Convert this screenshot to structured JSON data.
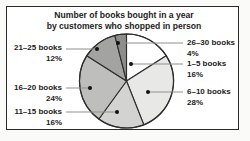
{
  "chart_data": {
    "type": "pie",
    "title_line1": "Number of books bought in a year",
    "title_line2": "by customers who shopped in person",
    "start_angle_deg": 0,
    "direction": "clockwise",
    "legend": "none",
    "label_style": "external-labels-with-dot-markers-and-leader-lines",
    "slices": [
      {
        "label": "1–5 books",
        "percent": "16%",
        "value": 16,
        "color": "#ffffff",
        "label_side": "right"
      },
      {
        "label": "6–10 books",
        "percent": "28%",
        "value": 28,
        "color": "#e8e8e7",
        "label_side": "right"
      },
      {
        "label": "11–15 books",
        "percent": "16%",
        "value": 16,
        "color": "#d3d3d2",
        "label_side": "left"
      },
      {
        "label": "16–20 books",
        "percent": "24%",
        "value": 24,
        "color": "#bebebd",
        "label_side": "left"
      },
      {
        "label": "21–25 books",
        "percent": "12%",
        "value": 12,
        "color": "#a3a3a2",
        "label_side": "left"
      },
      {
        "label": "26–30 books",
        "percent": "4%",
        "value": 4,
        "color": "#8d8d8c",
        "label_side": "right"
      }
    ]
  },
  "colors": {
    "panel_border": "#2b2b2b",
    "panel_background": "#ffffff",
    "slice_stroke": "#2e2e2e",
    "leader_line": "#8f8f8f",
    "marker_dot": "#111111",
    "text": "#1c1c1c"
  }
}
